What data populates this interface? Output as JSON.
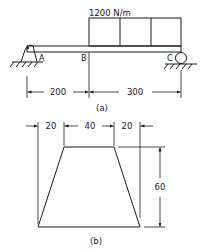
{
  "figure_a": {
    "load_label": "1200 N/m",
    "point_labels": {
      "a": "A",
      "b": "B",
      "c": "C"
    },
    "dimensions": [
      {
        "label": "200",
        "from": "A",
        "to": "B"
      },
      {
        "label": "300",
        "from": "B",
        "to": "C"
      }
    ],
    "caption": "(a)",
    "supports": {
      "A": "pin",
      "C": "roller"
    }
  },
  "figure_b": {
    "top_dimensions": [
      "20",
      "40",
      "20"
    ],
    "height_dimension": "60",
    "shape": "trapezoid",
    "caption": "(b)"
  },
  "colors": {
    "ink": "#1a1a1a",
    "background": "#ffffff"
  }
}
